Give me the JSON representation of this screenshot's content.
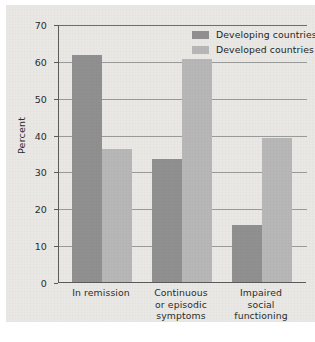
{
  "chart_data": {
    "type": "bar",
    "title": "",
    "xlabel": "",
    "ylabel": "Percent",
    "ylim": [
      0,
      70
    ],
    "yticks": [
      0,
      10,
      20,
      30,
      40,
      50,
      60,
      70
    ],
    "ytick_labels": [
      "0",
      "10",
      "20",
      "30",
      "40",
      "50",
      "60",
      "70"
    ],
    "grid": true,
    "legend_position": "top-right",
    "categories": [
      "In remission",
      "Continuous or episodic symptoms",
      "Impaired social functioning"
    ],
    "category_label_lines": [
      [
        "In remission"
      ],
      [
        "Continuous",
        "or episodic",
        "symptoms"
      ],
      [
        "Impaired",
        "social",
        "functioning"
      ]
    ],
    "series": [
      {
        "name": "Developing countries",
        "color": "#909090",
        "values": [
          61.5,
          33.5,
          15.5
        ]
      },
      {
        "name": "Developed countries",
        "color": "#b7b7b7",
        "values": [
          36.0,
          60.5,
          39.0
        ]
      }
    ]
  },
  "colors": {
    "developing": "#909090",
    "developed": "#b7b7b7",
    "axis": "#5b5b5b",
    "gridline": "#9a9a98",
    "background": "#e9e8e5",
    "text": "#2b2b2b"
  }
}
